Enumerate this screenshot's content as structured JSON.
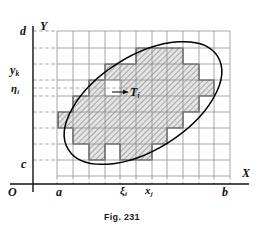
{
  "figure": {
    "caption": "Fig. 231",
    "axes": {
      "x_axis_label": "X",
      "y_axis_label": "Y",
      "origin_label": "O"
    },
    "x_ticks": [
      {
        "name": "a",
        "label": "a",
        "value": 0.0
      },
      {
        "name": "xi_i",
        "label": "ξ",
        "sub": "i",
        "value": 0.385
      },
      {
        "name": "x_j",
        "label": "x",
        "sub": "j",
        "value": 0.5
      },
      {
        "name": "b",
        "label": "b",
        "value": 1.0
      }
    ],
    "y_ticks": [
      {
        "name": "d",
        "label": "d",
        "value": 1.0
      },
      {
        "name": "y_k",
        "label": "y",
        "sub": "k",
        "value": 0.7
      },
      {
        "name": "eta_i",
        "label": "η",
        "sub": "i",
        "value": 0.565
      },
      {
        "name": "c",
        "label": "c",
        "value": 0.0
      }
    ],
    "annotations": [
      {
        "name": "cell-label-Ti",
        "label": "T",
        "sub": "i",
        "description": "partition cell inside region"
      }
    ],
    "colors": {
      "ink": "#111111",
      "grid_line": "#7a7a7a",
      "dashed_guide": "#8a8a8a",
      "curve": "#000000",
      "hatch": "#555555",
      "hatch_fill": "#d8d8d8",
      "background": "#ffffff"
    },
    "geometry": {
      "grid_left": 57,
      "grid_right": 230,
      "grid_top": 31,
      "grid_bottom": 176,
      "columns": 11,
      "rows": 9,
      "region_shape": "ellipse",
      "ellipse_center": [
        143,
        103
      ],
      "ellipse_rx": 88,
      "ellipse_ry": 47,
      "ellipse_rotation_deg": -32
    }
  }
}
